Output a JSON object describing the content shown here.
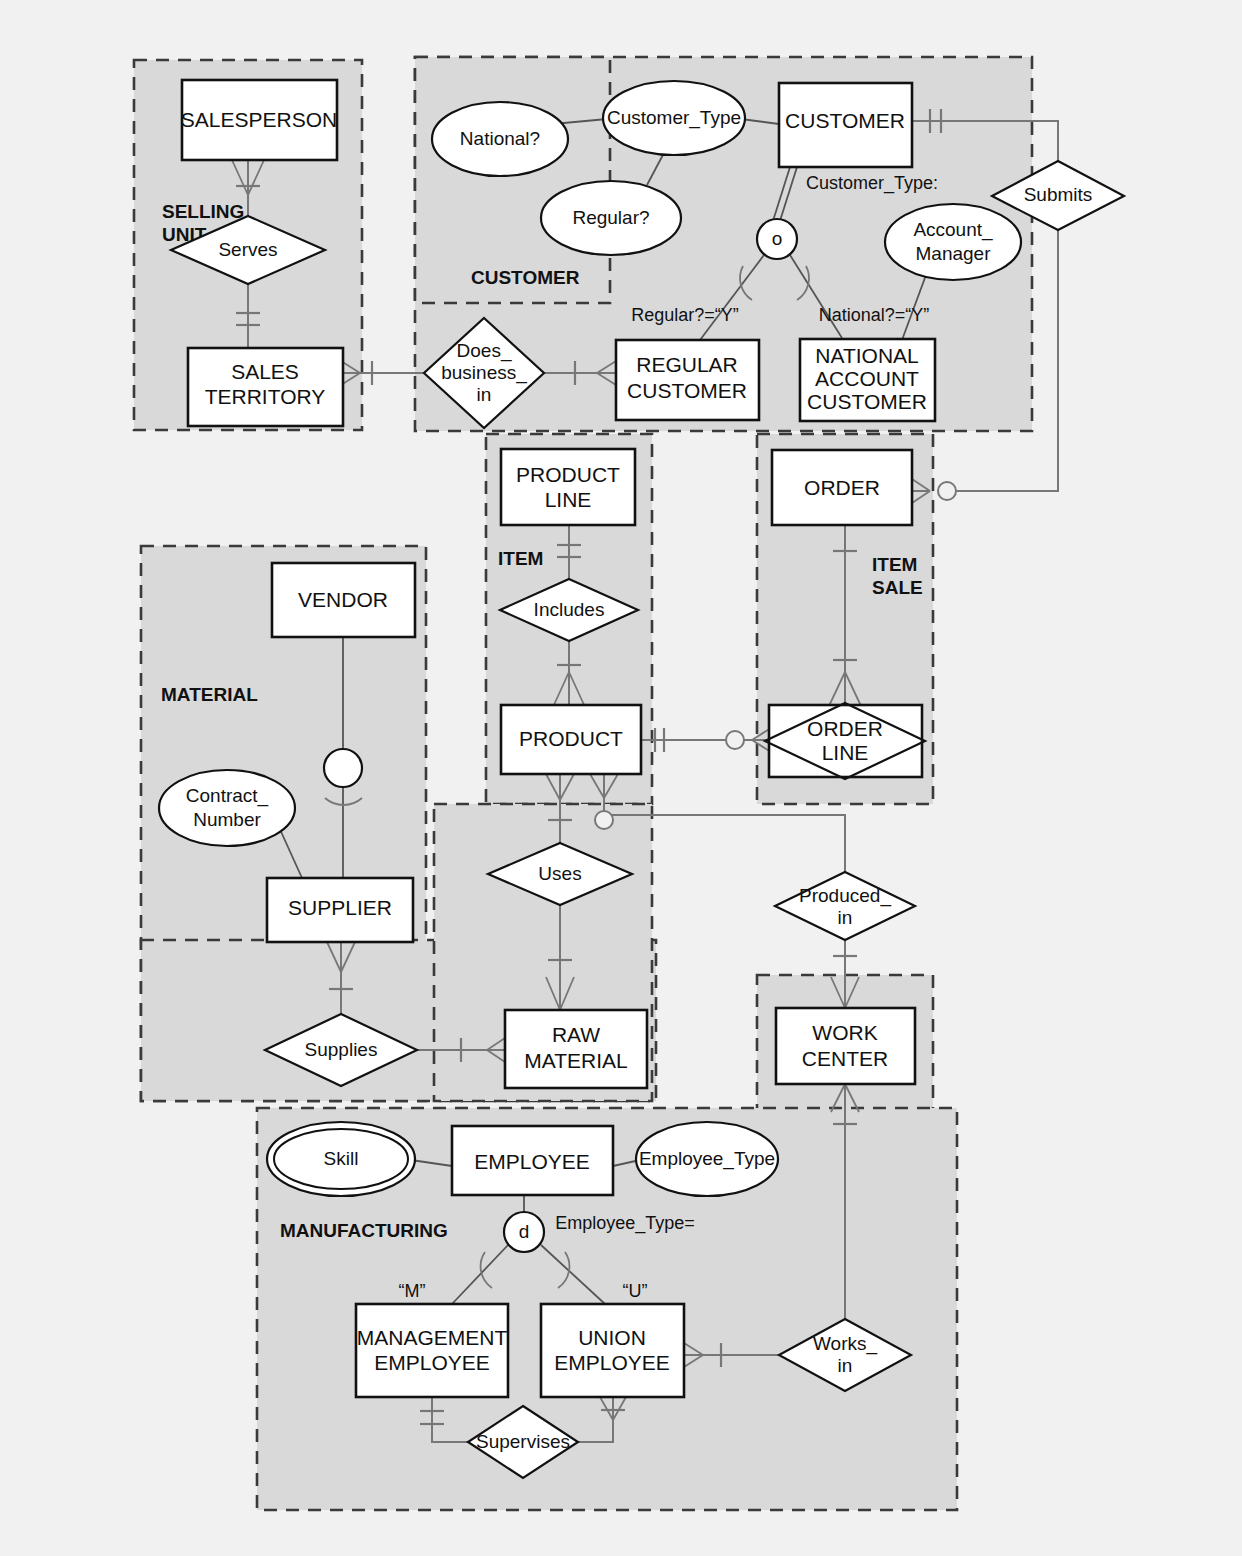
{
  "diagram": {
    "notation": "Crow's foot ER with subject areas, supertype/subtype and associative entities",
    "colors": {
      "page_background": "#f1f1f1",
      "subject_area_fill": "#d9d9d9",
      "subject_area_border": "#3a3a3a",
      "entity_fill": "#ffffff",
      "line": "#777777",
      "text": "#111111"
    }
  },
  "subject_areas": [
    {
      "id": "selling_unit",
      "label": "SELLING UNIT",
      "label_lines": [
        "SELLING",
        "UNIT"
      ]
    },
    {
      "id": "customer_outer",
      "label": "",
      "label_lines": []
    },
    {
      "id": "customer",
      "label": "CUSTOMER",
      "label_lines": [
        "CUSTOMER"
      ]
    },
    {
      "id": "item",
      "label": "ITEM",
      "label_lines": [
        "ITEM"
      ]
    },
    {
      "id": "item_sale",
      "label": "ITEM SALE",
      "label_lines": [
        "ITEM",
        "SALE"
      ]
    },
    {
      "id": "material",
      "label": "MATERIAL",
      "label_lines": [
        "MATERIAL"
      ]
    },
    {
      "id": "manufacturing",
      "label": "MANUFACTURING",
      "label_lines": [
        "MANUFACTURING"
      ]
    }
  ],
  "entities": [
    {
      "id": "salesperson",
      "name": "SALESPERSON",
      "lines": [
        "SALESPERSON"
      ],
      "kind": "entity"
    },
    {
      "id": "sales_territory",
      "name": "SALES TERRITORY",
      "lines": [
        "SALES",
        "TERRITORY"
      ],
      "kind": "entity"
    },
    {
      "id": "customer",
      "name": "CUSTOMER",
      "lines": [
        "CUSTOMER"
      ],
      "kind": "supertype"
    },
    {
      "id": "regular_customer",
      "name": "REGULAR CUSTOMER",
      "lines": [
        "REGULAR",
        "CUSTOMER"
      ],
      "kind": "subtype"
    },
    {
      "id": "national_account",
      "name": "NATIONAL ACCOUNT CUSTOMER",
      "lines": [
        "NATIONAL",
        "ACCOUNT",
        "CUSTOMER"
      ],
      "kind": "subtype"
    },
    {
      "id": "product_line",
      "name": "PRODUCT LINE",
      "lines": [
        "PRODUCT",
        "LINE"
      ],
      "kind": "entity"
    },
    {
      "id": "product",
      "name": "PRODUCT",
      "lines": [
        "PRODUCT"
      ],
      "kind": "entity"
    },
    {
      "id": "order",
      "name": "ORDER",
      "lines": [
        "ORDER"
      ],
      "kind": "entity"
    },
    {
      "id": "order_line",
      "name": "ORDER LINE",
      "lines": [
        "ORDER",
        "LINE"
      ],
      "kind": "associative"
    },
    {
      "id": "vendor",
      "name": "VENDOR",
      "lines": [
        "VENDOR"
      ],
      "kind": "supertype"
    },
    {
      "id": "supplier",
      "name": "SUPPLIER",
      "lines": [
        "SUPPLIER"
      ],
      "kind": "subtype"
    },
    {
      "id": "raw_material",
      "name": "RAW MATERIAL",
      "lines": [
        "RAW",
        "MATERIAL"
      ],
      "kind": "entity"
    },
    {
      "id": "work_center",
      "name": "WORK CENTER",
      "lines": [
        "WORK",
        "CENTER"
      ],
      "kind": "entity"
    },
    {
      "id": "employee",
      "name": "EMPLOYEE",
      "lines": [
        "EMPLOYEE"
      ],
      "kind": "supertype"
    },
    {
      "id": "mgmt_employee",
      "name": "MANAGEMENT EMPLOYEE",
      "lines": [
        "MANAGEMENT",
        "EMPLOYEE"
      ],
      "kind": "subtype"
    },
    {
      "id": "union_employee",
      "name": "UNION EMPLOYEE",
      "lines": [
        "UNION",
        "EMPLOYEE"
      ],
      "kind": "subtype"
    }
  ],
  "relationships": [
    {
      "id": "serves",
      "name": "Serves",
      "lines": [
        "Serves"
      ],
      "between": [
        "salesperson",
        "sales_territory"
      ]
    },
    {
      "id": "does_business_in",
      "name": "Does_business_in",
      "lines": [
        "Does_",
        "business_",
        "in"
      ],
      "between": [
        "sales_territory",
        "regular_customer"
      ]
    },
    {
      "id": "submits",
      "name": "Submits",
      "lines": [
        "Submits"
      ],
      "between": [
        "customer",
        "order"
      ]
    },
    {
      "id": "includes",
      "name": "Includes",
      "lines": [
        "Includes"
      ],
      "between": [
        "product_line",
        "product"
      ]
    },
    {
      "id": "order_line",
      "name": "ORDER LINE",
      "lines": [
        "ORDER",
        "LINE"
      ],
      "between": [
        "order",
        "product"
      ]
    },
    {
      "id": "uses",
      "name": "Uses",
      "lines": [
        "Uses"
      ],
      "between": [
        "product",
        "raw_material"
      ]
    },
    {
      "id": "produced_in",
      "name": "Produced_in",
      "lines": [
        "Produced_",
        "in"
      ],
      "between": [
        "product",
        "work_center"
      ]
    },
    {
      "id": "supplies",
      "name": "Supplies",
      "lines": [
        "Supplies"
      ],
      "between": [
        "supplier",
        "raw_material"
      ]
    },
    {
      "id": "works_in",
      "name": "Works_in",
      "lines": [
        "Works_",
        "in"
      ],
      "between": [
        "union_employee",
        "work_center"
      ]
    },
    {
      "id": "supervises",
      "name": "Supervises",
      "lines": [
        "Supervises"
      ],
      "between": [
        "mgmt_employee",
        "union_employee"
      ]
    }
  ],
  "attributes": [
    {
      "id": "national_q",
      "name": "National?",
      "lines": [
        "National?"
      ],
      "owner": "customer_type",
      "type": "simple"
    },
    {
      "id": "regular_q",
      "name": "Regular?",
      "lines": [
        "Regular?"
      ],
      "owner": "customer_type",
      "type": "simple"
    },
    {
      "id": "customer_type",
      "name": "Customer_Type",
      "lines": [
        "Customer_Type"
      ],
      "owner": "customer",
      "type": "composite"
    },
    {
      "id": "account_manager",
      "name": "Account_Manager",
      "lines": [
        "Account_",
        "Manager"
      ],
      "owner": "national_account",
      "type": "simple"
    },
    {
      "id": "contract_number",
      "name": "Contract_Number",
      "lines": [
        "Contract_",
        "Number"
      ],
      "owner": "supplier",
      "type": "simple"
    },
    {
      "id": "skill",
      "name": "Skill",
      "lines": [
        "Skill"
      ],
      "owner": "employee",
      "type": "multivalued"
    },
    {
      "id": "employee_type",
      "name": "Employee_Type",
      "lines": [
        "Employee_Type"
      ],
      "owner": "employee",
      "type": "simple"
    }
  ],
  "discriminators": [
    {
      "id": "customer_disc",
      "symbol": "o",
      "label": "Customer_Type:",
      "kind": "overlapping",
      "subtype_conditions": [
        "Regular?=\"Y\"",
        "National?=\"Y\""
      ]
    },
    {
      "id": "employee_disc",
      "symbol": "d",
      "label": "Employee_Type=",
      "kind": "disjoint",
      "subtype_conditions": [
        "“M”",
        "“U”"
      ]
    }
  ],
  "annotations": [
    {
      "id": "ann_customer_type",
      "text": "Customer_Type:"
    },
    {
      "id": "ann_regular_y",
      "text": "Regular?=“Y”"
    },
    {
      "id": "ann_national_y",
      "text": "National?=“Y”"
    },
    {
      "id": "ann_employee_type",
      "text": "Employee_Type="
    },
    {
      "id": "ann_m",
      "text": "“M”"
    },
    {
      "id": "ann_u",
      "text": "“U”"
    },
    {
      "id": "sym_overlapping",
      "text": "o"
    },
    {
      "id": "sym_disjoint",
      "text": "d"
    }
  ]
}
